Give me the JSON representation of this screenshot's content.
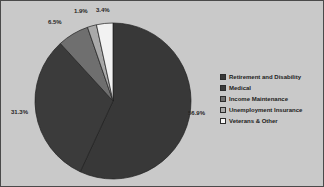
{
  "frame": {
    "background_color": "#c9c9c9",
    "border_color": "#4a4a4a",
    "width": 324,
    "height": 187
  },
  "chart_data": {
    "type": "pie",
    "title": "",
    "subtitle": "",
    "xlabel": "",
    "ylabel": "",
    "grid": false,
    "legend_position": "right",
    "start_angle_deg": 0,
    "direction": "clockwise",
    "categories": [
      "Retirement and Disability",
      "Medical",
      "Income Maintenance",
      "Unemployment Insurance",
      "Veterans & Other"
    ],
    "values": [
      56.9,
      31.3,
      6.5,
      1.9,
      3.4
    ],
    "value_labels": [
      "56.9%",
      "31.3%",
      "6.5%",
      "1.9%",
      "3.4%"
    ],
    "colors": [
      "#383838",
      "#3b3b3b",
      "#6f6f6f",
      "#a9a9a9",
      "#f2f2f2"
    ],
    "slices": [
      {
        "label": "Retirement and Disability",
        "value": 56.9,
        "value_label": "56.9%",
        "color": "#383838",
        "label_x": 187,
        "label_y": 108
      },
      {
        "label": "Medical",
        "value": 31.3,
        "value_label": "31.3%",
        "color": "#3b3b3b",
        "label_x": 10,
        "label_y": 107
      },
      {
        "label": "Income Maintenance",
        "value": 6.5,
        "value_label": "6.5%",
        "color": "#6f6f6f",
        "label_x": 47,
        "label_y": 17
      },
      {
        "label": "Unemployment Insurance",
        "value": 1.9,
        "value_label": "1.9%",
        "color": "#a9a9a9",
        "label_x": 73,
        "label_y": 6
      },
      {
        "label": "Veterans & Other",
        "value": 3.4,
        "value_label": "3.4%",
        "color": "#f2f2f2",
        "label_x": 95,
        "label_y": 5
      }
    ],
    "geometry": {
      "center_x": 112,
      "center_y": 100,
      "radius": 78
    }
  },
  "legend": {
    "items": [
      {
        "label": "Retirement and Disability",
        "color": "#383838"
      },
      {
        "label": "Medical",
        "color": "#3b3b3b"
      },
      {
        "label": "Income Maintenance",
        "color": "#6f6f6f"
      },
      {
        "label": "Unemployment Insurance",
        "color": "#a9a9a9"
      },
      {
        "label": "Veterans & Other",
        "color": "#f6f6f6"
      }
    ]
  }
}
